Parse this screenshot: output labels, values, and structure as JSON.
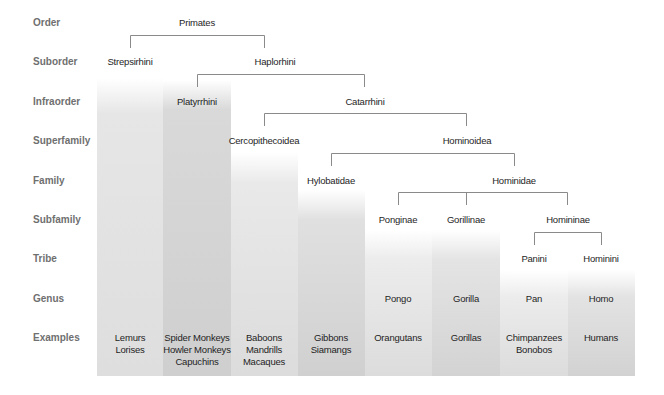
{
  "diagram": {
    "type": "taxonomy-tree",
    "ranks": [
      "Order",
      "Suborder",
      "Infraorder",
      "Superfamily",
      "Family",
      "Subfamily",
      "Tribe",
      "Genus",
      "Examples"
    ],
    "taxa": {
      "order": "Primates",
      "suborder": [
        "Strepsirhini",
        "Haplorhini"
      ],
      "infraorder": [
        "Platyrrhini",
        "Catarrhini"
      ],
      "superfamily": [
        "Cercopithecoidea",
        "Hominoidea"
      ],
      "family": [
        "Hylobatidae",
        "Hominidae"
      ],
      "subfamily": [
        "Ponginae",
        "Gorillinae",
        "Homininae"
      ],
      "tribe": [
        "Panini",
        "Hominini"
      ],
      "genus": [
        "Pongo",
        "Gorilla",
        "Pan",
        "Homo"
      ]
    },
    "examples": [
      {
        "lines": [
          "Lemurs",
          "Lorises"
        ]
      },
      {
        "lines": [
          "Spider Monkeys",
          "Howler Monkeys",
          "Capuchins"
        ]
      },
      {
        "lines": [
          "Baboons",
          "Mandrills",
          "Macaques"
        ]
      },
      {
        "lines": [
          "Gibbons",
          "Siamangs"
        ]
      },
      {
        "lines": [
          "Orangutans"
        ]
      },
      {
        "lines": [
          "Gorillas"
        ]
      },
      {
        "lines": [
          "Chimpanzees",
          "Bonobos"
        ]
      },
      {
        "lines": [
          "Humans"
        ]
      }
    ],
    "colors": {
      "rank_label": "#6f6f6f",
      "line": "#888888",
      "text": "#1e1e1e"
    }
  }
}
